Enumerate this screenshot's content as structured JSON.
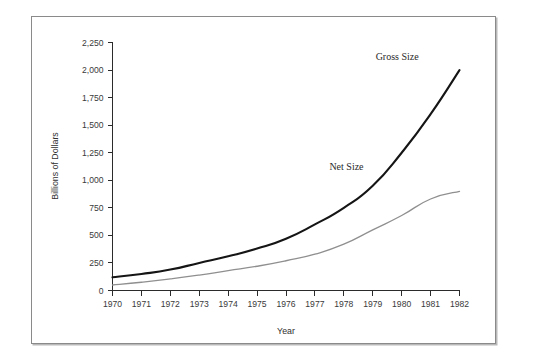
{
  "chart_data": {
    "type": "line",
    "title": "",
    "xlabel": "Year",
    "ylabel": "Billions of Dollars",
    "x": [
      1970,
      1971,
      1972,
      1973,
      1974,
      1975,
      1976,
      1977,
      1978,
      1979,
      1980,
      1981,
      1982
    ],
    "xtick_labels": [
      "1970",
      "1971",
      "1972",
      "1973",
      "1974",
      "1975",
      "1976",
      "1977",
      "1978",
      "1979",
      "1980",
      "1981",
      "1982"
    ],
    "ytick_labels": [
      "0",
      "250",
      "500",
      "750",
      "1,000",
      "1,250",
      "1,500",
      "1,750",
      "2,000",
      "2,250"
    ],
    "ytick_values": [
      0,
      250,
      500,
      750,
      1000,
      1250,
      1500,
      1750,
      2000,
      2250
    ],
    "ylim": [
      0,
      2250
    ],
    "xlim": [
      1970,
      1982
    ],
    "grid": false,
    "legend_position": "inline-annotation",
    "series": [
      {
        "name": "Gross Size",
        "color": "#151515",
        "values": [
          120,
          150,
          190,
          250,
          310,
          380,
          470,
          600,
          750,
          950,
          1250,
          1600,
          2000
        ],
        "label_x": 1979.1,
        "label_y": 2090
      },
      {
        "name": "Net Size",
        "color": "#8f8f8f",
        "values": [
          50,
          75,
          105,
          140,
          180,
          220,
          270,
          330,
          420,
          550,
          680,
          830,
          900
        ],
        "label_x": 1977.5,
        "label_y": 1090
      }
    ]
  },
  "figure": {
    "axis_title_x": "Year",
    "axis_title_y": "Billions of Dollars"
  }
}
